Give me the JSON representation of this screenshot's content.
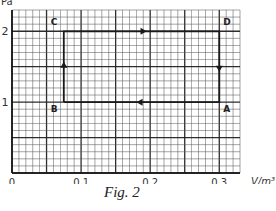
{
  "chart_data": {
    "type": "line",
    "title": "",
    "caption": "Fig. 2",
    "xlabel": "V/m³",
    "ylabel": "p/Pa",
    "ylabel_visible_fragment": "Pa",
    "xlim": [
      0,
      0.33
    ],
    "ylim": [
      0,
      2.3
    ],
    "x_ticks": [
      {
        "value": 0,
        "label": "0"
      },
      {
        "value": 0.1,
        "label": "0.1"
      },
      {
        "value": 0.2,
        "label": "0.2"
      },
      {
        "value": 0.3,
        "label": "0.3"
      }
    ],
    "y_ticks": [
      {
        "value": 1,
        "label": "1"
      },
      {
        "value": 2,
        "label": "2"
      }
    ],
    "grid": {
      "on": true,
      "x_minor": 0.01,
      "x_major": 0.05,
      "y_minor": 0.1,
      "y_major": 0.5
    },
    "points": [
      {
        "label": "A",
        "V": 0.3,
        "p": 1
      },
      {
        "label": "B",
        "V": 0.075,
        "p": 1
      },
      {
        "label": "C",
        "V": 0.075,
        "p": 2
      },
      {
        "label": "D",
        "V": 0.3,
        "p": 2
      }
    ],
    "cycle_order": [
      "B",
      "C",
      "D",
      "A",
      "B"
    ],
    "series": [
      {
        "name": "cycle",
        "x": [
          0.075,
          0.075,
          0.3,
          0.3,
          0.075
        ],
        "y": [
          1,
          2,
          2,
          1,
          1
        ]
      }
    ],
    "colors": {
      "line": "#1a1a1a",
      "grid_minor": "#555555",
      "grid_major": "#222222"
    }
  }
}
